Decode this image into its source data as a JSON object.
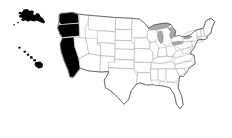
{
  "figure": {
    "kind": "choropleth-map",
    "region": "United States of America",
    "background_color": "#ffffff",
    "width": 232,
    "height": 138
  },
  "legend_colors": {
    "highlight_fill": "#000000",
    "default_fill": "#ffffff",
    "state_border": "#8c8c8c",
    "national_outline": "#4a4a4a",
    "lake_fill": "#a8a8a8"
  },
  "highlighted_states": [
    "Alaska",
    "Hawaii",
    "Washington",
    "Oregon",
    "California"
  ],
  "water_bodies": [
    "Lake Superior",
    "Lake Michigan",
    "Lake Huron",
    "Lake Erie",
    "Lake Ontario"
  ],
  "insets": [
    {
      "name": "Alaska",
      "highlighted": true
    },
    {
      "name": "Hawaii",
      "highlighted": true
    }
  ],
  "contiguous_states": [
    {
      "name": "Washington",
      "highlighted": true
    },
    {
      "name": "Oregon",
      "highlighted": true
    },
    {
      "name": "California",
      "highlighted": true
    },
    {
      "name": "Idaho",
      "highlighted": false
    },
    {
      "name": "Nevada",
      "highlighted": false
    },
    {
      "name": "Arizona",
      "highlighted": false
    },
    {
      "name": "Utah",
      "highlighted": false
    },
    {
      "name": "Montana",
      "highlighted": false
    },
    {
      "name": "Wyoming",
      "highlighted": false
    },
    {
      "name": "Colorado",
      "highlighted": false
    },
    {
      "name": "New Mexico",
      "highlighted": false
    },
    {
      "name": "North Dakota",
      "highlighted": false
    },
    {
      "name": "South Dakota",
      "highlighted": false
    },
    {
      "name": "Nebraska",
      "highlighted": false
    },
    {
      "name": "Kansas",
      "highlighted": false
    },
    {
      "name": "Oklahoma",
      "highlighted": false
    },
    {
      "name": "Texas",
      "highlighted": false
    },
    {
      "name": "Minnesota",
      "highlighted": false
    },
    {
      "name": "Iowa",
      "highlighted": false
    },
    {
      "name": "Missouri",
      "highlighted": false
    },
    {
      "name": "Arkansas",
      "highlighted": false
    },
    {
      "name": "Louisiana",
      "highlighted": false
    },
    {
      "name": "Wisconsin",
      "highlighted": false
    },
    {
      "name": "Illinois",
      "highlighted": false
    },
    {
      "name": "Michigan",
      "highlighted": false
    },
    {
      "name": "Indiana",
      "highlighted": false
    },
    {
      "name": "Ohio",
      "highlighted": false
    },
    {
      "name": "Kentucky",
      "highlighted": false
    },
    {
      "name": "Tennessee",
      "highlighted": false
    },
    {
      "name": "Mississippi",
      "highlighted": false
    },
    {
      "name": "Alabama",
      "highlighted": false
    },
    {
      "name": "Georgia",
      "highlighted": false
    },
    {
      "name": "Florida",
      "highlighted": false
    },
    {
      "name": "South Carolina",
      "highlighted": false
    },
    {
      "name": "North Carolina",
      "highlighted": false
    },
    {
      "name": "Virginia",
      "highlighted": false
    },
    {
      "name": "West Virginia",
      "highlighted": false
    },
    {
      "name": "Maryland",
      "highlighted": false
    },
    {
      "name": "Delaware",
      "highlighted": false
    },
    {
      "name": "Pennsylvania",
      "highlighted": false
    },
    {
      "name": "New Jersey",
      "highlighted": false
    },
    {
      "name": "New York",
      "highlighted": false
    },
    {
      "name": "Connecticut",
      "highlighted": false
    },
    {
      "name": "Rhode Island",
      "highlighted": false
    },
    {
      "name": "Massachusetts",
      "highlighted": false
    },
    {
      "name": "Vermont",
      "highlighted": false
    },
    {
      "name": "New Hampshire",
      "highlighted": false
    },
    {
      "name": "Maine",
      "highlighted": false
    }
  ]
}
